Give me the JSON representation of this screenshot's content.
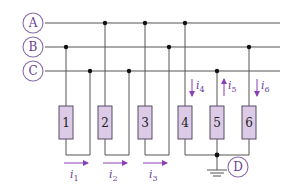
{
  "diagram": {
    "type": "three-phase load circuit",
    "nodes": [
      {
        "id": "A",
        "label": "A"
      },
      {
        "id": "B",
        "label": "B"
      },
      {
        "id": "C",
        "label": "C"
      },
      {
        "id": "D",
        "label": "D"
      }
    ],
    "resistors": [
      {
        "label": "1",
        "top_line": "B",
        "return_line": "C"
      },
      {
        "label": "2",
        "top_line": "A",
        "return_line": "C"
      },
      {
        "label": "3",
        "top_line": "A",
        "return_line": "B"
      },
      {
        "label": "4",
        "top_line": "A",
        "return_line": "D"
      },
      {
        "label": "5",
        "top_line": "C",
        "return_line": "D"
      },
      {
        "label": "6",
        "top_line": "B",
        "return_line": "D"
      }
    ],
    "currents": [
      {
        "symbol": "i",
        "sub": "1",
        "direction": "right"
      },
      {
        "symbol": "i",
        "sub": "2",
        "direction": "right"
      },
      {
        "symbol": "i",
        "sub": "3",
        "direction": "right"
      },
      {
        "symbol": "i",
        "sub": "4",
        "direction": "down"
      },
      {
        "symbol": "i",
        "sub": "5",
        "direction": "up"
      },
      {
        "symbol": "i",
        "sub": "6",
        "direction": "down"
      }
    ],
    "ground": "D",
    "colors": {
      "resistor_fill": "#dccbe6",
      "accent": "#8a3fb3",
      "node_text": "#6b3f96",
      "wire": "#555555"
    }
  }
}
